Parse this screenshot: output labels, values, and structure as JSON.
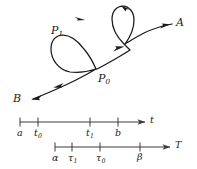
{
  "figure": {
    "background_color": "#ffffff",
    "ink_color": "#1a1a1a",
    "axis_color": "#3a3a3a"
  },
  "curve": {
    "endpoint_start_label": "A",
    "endpoint_end_label": "B",
    "loop_upper_label": "P",
    "loop_upper_sub": "1",
    "node_lower_label": "P",
    "node_lower_sub": "0",
    "direction_arrow_count": 5
  },
  "axes": [
    {
      "name": "t-axis",
      "axis_label": "t",
      "ticks": [
        {
          "label": "a",
          "sub": "",
          "x": 20
        },
        {
          "label": "t",
          "sub": "0",
          "x": 38
        },
        {
          "label": "t",
          "sub": "1",
          "x": 90
        },
        {
          "label": "b",
          "sub": "",
          "x": 118
        }
      ]
    },
    {
      "name": "T-axis",
      "axis_label": "T",
      "ticks": [
        {
          "label": "α",
          "sub": "",
          "x": 55
        },
        {
          "label": "τ",
          "sub": "1",
          "x": 72
        },
        {
          "label": "τ",
          "sub": "0",
          "x": 100
        },
        {
          "label": "β",
          "sub": "",
          "x": 140
        }
      ]
    }
  ]
}
